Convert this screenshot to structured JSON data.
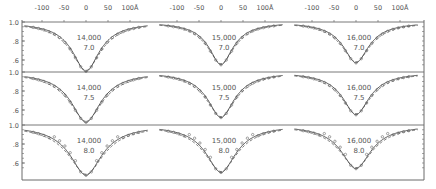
{
  "figure": {
    "x_axis_unit": "Å",
    "x_tick_labels": [
      "-100",
      "-50",
      "0",
      "50",
      "100Å"
    ],
    "y_tick_labels": [
      "1.0",
      ".8",
      ".6"
    ],
    "panel_labels": [
      {
        "temp": "14,000",
        "logg": "7.0"
      },
      {
        "temp": "15,000",
        "logg": "7.0"
      },
      {
        "temp": "16,000",
        "logg": "7.0"
      },
      {
        "temp": "14,000",
        "logg": "7.5"
      },
      {
        "temp": "15,000",
        "logg": "7.5"
      },
      {
        "temp": "16,000",
        "logg": "7.5"
      },
      {
        "temp": "14,000",
        "logg": "8.0"
      },
      {
        "temp": "15,000",
        "logg": "8.0"
      },
      {
        "temp": "16,000",
        "logg": "8.0"
      }
    ]
  },
  "chart_data": {
    "type": "line",
    "title": "",
    "xlabel": "Δλ (Å)",
    "ylabel": "Relative flux",
    "xlim": [
      -140,
      140
    ],
    "ylim": [
      0.44,
      1.02
    ],
    "grid": false,
    "layout": "3x3 panels; columns Teff = 14,000 / 15,000 / 16,000; rows log g = 7.0 / 7.5 / 8.0",
    "x_ticks": [
      -100,
      -50,
      0,
      50,
      100
    ],
    "y_ticks": [
      0.6,
      0.8,
      1.0
    ],
    "series_styles": [
      {
        "name": "model (solid)",
        "style": "solid"
      },
      {
        "name": "model (dashed)",
        "style": "dashed"
      },
      {
        "name": "observed",
        "style": "open circles"
      }
    ],
    "panels": [
      {
        "teff": "14,000",
        "logg": "7.0",
        "min_depth": 0.48,
        "half_width_A": 38
      },
      {
        "teff": "15,000",
        "logg": "7.0",
        "min_depth": 0.55,
        "half_width_A": 34
      },
      {
        "teff": "16,000",
        "logg": "7.0",
        "min_depth": 0.57,
        "half_width_A": 36
      },
      {
        "teff": "14,000",
        "logg": "7.5",
        "min_depth": 0.47,
        "half_width_A": 42
      },
      {
        "teff": "15,000",
        "logg": "7.5",
        "min_depth": 0.52,
        "half_width_A": 38
      },
      {
        "teff": "16,000",
        "logg": "7.5",
        "min_depth": 0.55,
        "half_width_A": 38
      },
      {
        "teff": "14,000",
        "logg": "8.0",
        "min_depth": 0.47,
        "half_width_A": 45
      },
      {
        "teff": "15,000",
        "logg": "8.0",
        "min_depth": 0.5,
        "half_width_A": 42
      },
      {
        "teff": "16,000",
        "logg": "8.0",
        "min_depth": 0.54,
        "half_width_A": 42
      }
    ]
  }
}
